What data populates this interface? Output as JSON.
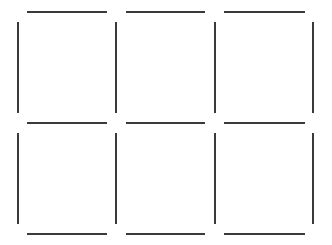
{
  "game": {
    "type": "dots-and-boxes",
    "rows": 2,
    "cols": 3,
    "line_color": "#3a3a3a",
    "background": "#ffffff"
  },
  "grid": {
    "x_dots": [
      18,
      116,
      215,
      313
    ],
    "y_dots": [
      12,
      123,
      234
    ],
    "h_segments": [
      {
        "row": 0,
        "col": 0,
        "x1": 27,
        "x2": 107,
        "y": 11,
        "drawn": true
      },
      {
        "row": 0,
        "col": 1,
        "x1": 126,
        "x2": 205,
        "y": 11,
        "drawn": true
      },
      {
        "row": 0,
        "col": 2,
        "x1": 224,
        "x2": 305,
        "y": 11,
        "drawn": true
      },
      {
        "row": 1,
        "col": 0,
        "x1": 27,
        "x2": 107,
        "y": 122,
        "drawn": true
      },
      {
        "row": 1,
        "col": 1,
        "x1": 126,
        "x2": 205,
        "y": 122,
        "drawn": true
      },
      {
        "row": 1,
        "col": 2,
        "x1": 224,
        "x2": 305,
        "y": 122,
        "drawn": true
      },
      {
        "row": 2,
        "col": 0,
        "x1": 27,
        "x2": 107,
        "y": 233,
        "drawn": true
      },
      {
        "row": 2,
        "col": 1,
        "x1": 126,
        "x2": 205,
        "y": 233,
        "drawn": true
      },
      {
        "row": 2,
        "col": 2,
        "x1": 224,
        "x2": 305,
        "y": 233,
        "drawn": true
      }
    ],
    "v_segments": [
      {
        "row": 0,
        "col": 0,
        "x": 17,
        "y1": 22,
        "y2": 113,
        "drawn": true
      },
      {
        "row": 0,
        "col": 1,
        "x": 115,
        "y1": 22,
        "y2": 113,
        "drawn": true
      },
      {
        "row": 0,
        "col": 2,
        "x": 214,
        "y1": 22,
        "y2": 113,
        "drawn": true
      },
      {
        "row": 0,
        "col": 3,
        "x": 312,
        "y1": 22,
        "y2": 113,
        "drawn": true
      },
      {
        "row": 1,
        "col": 0,
        "x": 17,
        "y1": 133,
        "y2": 224,
        "drawn": true
      },
      {
        "row": 1,
        "col": 1,
        "x": 115,
        "y1": 133,
        "y2": 224,
        "drawn": true
      },
      {
        "row": 1,
        "col": 2,
        "x": 214,
        "y1": 133,
        "y2": 224,
        "drawn": true
      },
      {
        "row": 1,
        "col": 3,
        "x": 312,
        "y1": 133,
        "y2": 224,
        "drawn": true
      }
    ]
  }
}
